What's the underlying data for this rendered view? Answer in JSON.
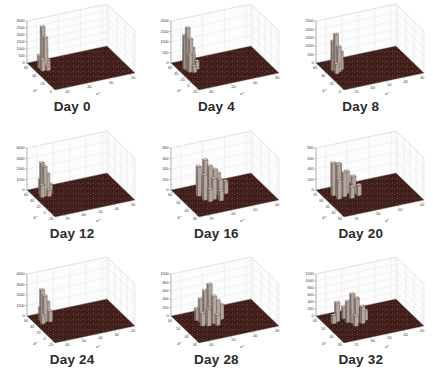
{
  "figure": {
    "background": "#ffffff",
    "kind": "3x3 grid of 3D bivariate histograms (MATLAB hist3 style)"
  },
  "colors": {
    "floor_base": "#3f1f1b",
    "floor_noise": [
      "#6d392f",
      "#1f0f0c",
      "#7a4035",
      "#54291f",
      "#2a1411",
      "#5e2f28",
      "#47231d",
      "#6a352a"
    ],
    "bar_top": "#cfc6be",
    "bar_side_right": "#b3a79e",
    "bar_side_left": "#94867d",
    "bar_edge": "#3c3430",
    "wall": "#fcfcfc",
    "grid_line": "#d9d9d9",
    "axis_line": "#666666",
    "tick_text": "#333333",
    "title_text": "#2b2b2b"
  },
  "chart_data": {
    "type": "3d-histogram-grid",
    "layout": {
      "rows": 3,
      "cols": 3,
      "legend": "none",
      "grid": "on"
    },
    "xlabel": "b*",
    "ylabel": "a*",
    "zlabel": "",
    "panels": [
      {
        "title": "Day 0",
        "xlabel": "b*",
        "ylabel": "a*",
        "z_ticks": [
          0,
          500,
          1000,
          1500,
          2000,
          2500,
          3000
        ],
        "x_ticks": [
          60,
          40,
          20,
          0
        ],
        "y_ticks": [
          -50,
          -40,
          -30,
          -20
        ],
        "zmax": 3000,
        "peak_count": 3000,
        "bin_frac": [
          0.05,
          0.045
        ],
        "bars": [
          [
            0.2,
            0.06,
            900
          ],
          [
            0.24,
            0.08,
            3000
          ],
          [
            0.28,
            0.1,
            2300
          ],
          [
            0.22,
            0.12,
            1500
          ],
          [
            0.3,
            0.06,
            800
          ],
          [
            0.26,
            0.14,
            600
          ],
          [
            0.18,
            0.1,
            400
          ],
          [
            0.32,
            0.12,
            300
          ]
        ]
      },
      {
        "title": "Day 4",
        "xlabel": "b*",
        "ylabel": "a*",
        "z_ticks": [
          0,
          500,
          1000,
          1500,
          2000
        ],
        "x_ticks": [
          60,
          40,
          20,
          0,
          -20
        ],
        "y_ticks": [
          -60,
          -50,
          -40,
          -30
        ],
        "zmax": 2000,
        "peak_count": 2000,
        "bin_frac": [
          0.05,
          0.045
        ],
        "bars": [
          [
            0.28,
            0.08,
            2000
          ],
          [
            0.24,
            0.06,
            1600
          ],
          [
            0.32,
            0.1,
            1500
          ],
          [
            0.2,
            0.08,
            1100
          ],
          [
            0.28,
            0.14,
            1000
          ],
          [
            0.36,
            0.08,
            800
          ],
          [
            0.24,
            0.16,
            600
          ],
          [
            0.16,
            0.1,
            500
          ],
          [
            0.32,
            0.18,
            400
          ],
          [
            0.4,
            0.12,
            300
          ]
        ]
      },
      {
        "title": "Day 8",
        "xlabel": "b*",
        "ylabel": "a*",
        "z_ticks": [
          0,
          500,
          1000,
          1500,
          2000,
          2500
        ],
        "x_ticks": [
          60,
          40,
          20,
          0
        ],
        "y_ticks": [
          -70,
          -60,
          -50,
          -40,
          -30
        ],
        "zmax": 2500,
        "peak_count": 2200,
        "bin_frac": [
          0.05,
          0.045
        ],
        "bars": [
          [
            0.34,
            0.1,
            2200
          ],
          [
            0.3,
            0.08,
            1750
          ],
          [
            0.38,
            0.12,
            1500
          ],
          [
            0.34,
            0.16,
            1100
          ],
          [
            0.26,
            0.1,
            900
          ],
          [
            0.42,
            0.08,
            600
          ],
          [
            0.3,
            0.18,
            500
          ],
          [
            0.22,
            0.14,
            350
          ]
        ]
      },
      {
        "title": "Day 12",
        "xlabel": "b*",
        "ylabel": "a*",
        "z_ticks": [
          0,
          1000,
          2000,
          3000,
          4000
        ],
        "x_ticks": [
          60,
          40,
          20,
          0,
          -20
        ],
        "y_ticks": [
          -70,
          -60,
          -50,
          -40,
          -30
        ],
        "zmax": 4000,
        "peak_count": 3100,
        "bin_frac": [
          0.05,
          0.045
        ],
        "bars": [
          [
            0.22,
            0.08,
            3100
          ],
          [
            0.26,
            0.1,
            2800
          ],
          [
            0.24,
            0.14,
            2000
          ],
          [
            0.18,
            0.08,
            1400
          ],
          [
            0.28,
            0.06,
            1200
          ],
          [
            0.22,
            0.18,
            900
          ],
          [
            0.3,
            0.14,
            600
          ]
        ]
      },
      {
        "title": "Day 16",
        "xlabel": "b*",
        "ylabel": "a*",
        "z_ticks": [
          0,
          200,
          400,
          600,
          800
        ],
        "x_ticks": [
          60,
          50,
          40,
          30
        ],
        "y_ticks": [
          -70,
          -60,
          -50,
          -40
        ],
        "zmax": 800,
        "peak_count": 700,
        "bin_frac": [
          0.055,
          0.05
        ],
        "bars": [
          [
            0.38,
            0.26,
            700
          ],
          [
            0.32,
            0.2,
            560
          ],
          [
            0.44,
            0.3,
            600
          ],
          [
            0.48,
            0.22,
            480
          ],
          [
            0.28,
            0.3,
            440
          ],
          [
            0.38,
            0.38,
            480
          ],
          [
            0.52,
            0.32,
            400
          ],
          [
            0.32,
            0.44,
            360
          ],
          [
            0.46,
            0.42,
            320
          ],
          [
            0.22,
            0.24,
            280
          ],
          [
            0.56,
            0.26,
            240
          ],
          [
            0.42,
            0.5,
            240
          ],
          [
            0.26,
            0.38,
            220
          ],
          [
            0.6,
            0.38,
            180
          ]
        ]
      },
      {
        "title": "Day 20",
        "xlabel": "b*",
        "ylabel": "a*",
        "z_ticks": [
          0,
          200,
          400,
          600,
          800
        ],
        "x_ticks": [
          70,
          60,
          50,
          40,
          30
        ],
        "y_ticks": [
          -70,
          -60,
          -50,
          -40
        ],
        "zmax": 800,
        "peak_count": 620,
        "bin_frac": [
          0.055,
          0.05
        ],
        "bars": [
          [
            0.24,
            0.1,
            620
          ],
          [
            0.3,
            0.14,
            600
          ],
          [
            0.2,
            0.18,
            560
          ],
          [
            0.34,
            0.2,
            460
          ],
          [
            0.26,
            0.26,
            420
          ],
          [
            0.38,
            0.12,
            380
          ],
          [
            0.32,
            0.32,
            340
          ],
          [
            0.18,
            0.28,
            260
          ],
          [
            0.44,
            0.26,
            220
          ],
          [
            0.4,
            0.36,
            200
          ]
        ]
      },
      {
        "title": "Day 24",
        "xlabel": "b*",
        "ylabel": "a*",
        "z_ticks": [
          0,
          1000,
          2000,
          3000,
          4000
        ],
        "x_ticks": [
          60,
          40,
          20,
          0,
          -20
        ],
        "y_ticks": [
          -60,
          -50,
          -40,
          -30,
          -20
        ],
        "zmax": 4000,
        "peak_count": 3000,
        "bin_frac": [
          0.05,
          0.045
        ],
        "bars": [
          [
            0.22,
            0.08,
            3000
          ],
          [
            0.26,
            0.1,
            2500
          ],
          [
            0.24,
            0.14,
            1800
          ],
          [
            0.18,
            0.08,
            1200
          ],
          [
            0.28,
            0.16,
            1000
          ],
          [
            0.3,
            0.06,
            800
          ],
          [
            0.2,
            0.18,
            600
          ]
        ]
      },
      {
        "title": "Day 28",
        "xlabel": "b*",
        "ylabel": "a*",
        "z_ticks": [
          0,
          200,
          400,
          600,
          800,
          1000
        ],
        "x_ticks": [
          60,
          50,
          40,
          30
        ],
        "y_ticks": [
          -60,
          -50,
          -40,
          -30
        ],
        "zmax": 1000,
        "peak_count": 920,
        "bin_frac": [
          0.055,
          0.05
        ],
        "bars": [
          [
            0.42,
            0.3,
            920
          ],
          [
            0.38,
            0.26,
            760
          ],
          [
            0.46,
            0.34,
            650
          ],
          [
            0.34,
            0.22,
            560
          ],
          [
            0.42,
            0.4,
            500
          ],
          [
            0.3,
            0.3,
            450
          ],
          [
            0.5,
            0.26,
            400
          ],
          [
            0.46,
            0.2,
            300
          ],
          [
            0.38,
            0.46,
            350
          ],
          [
            0.26,
            0.2,
            280
          ],
          [
            0.54,
            0.36,
            250
          ],
          [
            0.22,
            0.28,
            200
          ]
        ]
      },
      {
        "title": "Day 32",
        "xlabel": "b*",
        "ylabel": "a*",
        "z_ticks": [
          0,
          200,
          400,
          600,
          800,
          1000,
          1200
        ],
        "x_ticks": [
          60,
          50,
          40,
          30
        ],
        "y_ticks": [
          -70,
          -60,
          -50,
          -40,
          -30
        ],
        "zmax": 1200,
        "peak_count": 820,
        "bin_frac": [
          0.055,
          0.05
        ],
        "bars": [
          [
            0.4,
            0.28,
            820
          ],
          [
            0.44,
            0.32,
            720
          ],
          [
            0.36,
            0.24,
            600
          ],
          [
            0.26,
            0.14,
            540
          ],
          [
            0.48,
            0.38,
            480
          ],
          [
            0.32,
            0.34,
            420
          ],
          [
            0.22,
            0.24,
            340
          ],
          [
            0.52,
            0.28,
            300
          ],
          [
            0.4,
            0.44,
            280
          ],
          [
            0.3,
            0.08,
            240
          ]
        ]
      }
    ]
  }
}
